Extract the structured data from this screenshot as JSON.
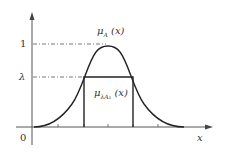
{
  "diagram": {
    "type": "fuzzy-membership-function",
    "axes": {
      "x_label": "x",
      "origin_label": "0",
      "y_ticks": [
        "1",
        "λ"
      ]
    },
    "curves": [
      {
        "name": "μ_A(x)",
        "label_main": "μ",
        "label_sub": "A",
        "label_arg": "(x)",
        "shape": "bell"
      },
      {
        "name": "μ_λA_λ(x)",
        "label_main": "μ",
        "label_sub": "λA",
        "label_subsub": "λ",
        "label_arg": "(x)",
        "shape": "rectangle at height λ"
      }
    ],
    "colors": {
      "line": "#222222",
      "dash": "#555555",
      "text": "#333333"
    }
  }
}
